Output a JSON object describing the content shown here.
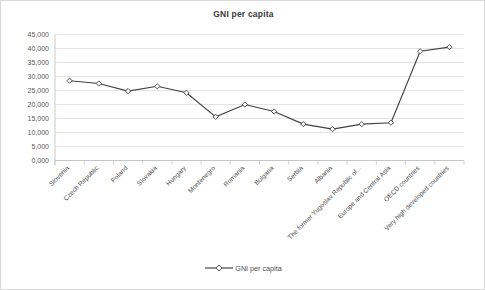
{
  "chart_data": {
    "type": "line",
    "title": "GNI per capita",
    "xlabel": "",
    "ylabel": "",
    "ylim": [
      0,
      45000
    ],
    "ytick_step": 5000,
    "ytick_labels": [
      "0,000",
      "5,000",
      "10,000",
      "15,000",
      "20,000",
      "25,000",
      "30,000",
      "35,000",
      "40,000",
      "45,000"
    ],
    "grid": true,
    "legend_position": "bottom",
    "legend": [
      "GNI per capita"
    ],
    "marker": "diamond-open",
    "line_color": "#404040",
    "marker_fill": "#ffffff",
    "grid_color": "#d9d9d9",
    "categories": [
      "Slovenia",
      "Czech Republic",
      "Poland",
      "Slovakia",
      "Hungary",
      "Montenegro",
      "Romania",
      "Bulgaria",
      "Serbia",
      "Albania",
      "The former Yugoslav Republic of...",
      "Europe and Central Asia",
      "OECD countries",
      "Very high developed countries"
    ],
    "series": [
      {
        "name": "GNI per capita",
        "values": [
          28500,
          27500,
          24800,
          26500,
          24200,
          15600,
          20000,
          17500,
          13000,
          11200,
          13000,
          13500,
          39000,
          40500
        ]
      }
    ]
  },
  "legend": {
    "label": "GNI per capita"
  }
}
